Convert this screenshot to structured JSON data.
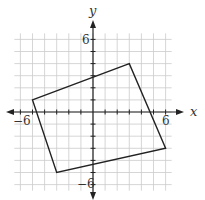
{
  "figure": {
    "type": "coordinate-plane",
    "axes": {
      "x_label": "x",
      "y_label": "y",
      "x_ticks_labeled": [
        {
          "value": -6,
          "label": "-6"
        },
        {
          "value": 6,
          "label": "6"
        }
      ],
      "y_ticks_labeled": [
        {
          "value": 6,
          "label": "6"
        },
        {
          "value": -6,
          "label": "-6"
        }
      ],
      "range": [
        -6.5,
        6.5
      ],
      "grid": true
    },
    "shape": {
      "kind": "quadrilateral",
      "vertices": [
        [
          -5,
          1
        ],
        [
          3,
          4
        ],
        [
          6,
          -3
        ],
        [
          -3,
          -5
        ]
      ]
    },
    "colors": {
      "grid": "#cccccc",
      "axis": "#222222",
      "shape": "#222222",
      "background": "#ffffff"
    }
  }
}
